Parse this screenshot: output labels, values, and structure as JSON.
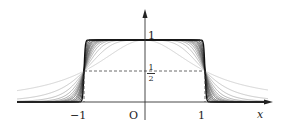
{
  "diagram": {
    "title": "",
    "axes": {
      "x_label": "x",
      "origin_label": "O",
      "x_ticks": [
        {
          "value": -1,
          "label": "−1"
        },
        {
          "value": 1,
          "label": "1"
        }
      ],
      "y_ticks": [
        {
          "value": 1,
          "label": "1"
        },
        {
          "value": 0.5,
          "label_num": "1",
          "label_den": "2"
        }
      ]
    },
    "curves": {
      "family": "1/(1+x^(2n))",
      "n_values": [
        1,
        2,
        3,
        4,
        5,
        6,
        7,
        8,
        10,
        12,
        15,
        20,
        30,
        50
      ],
      "color_light": "#c8c8c8",
      "color_dark": "#111111"
    },
    "guides": {
      "half_line": "dashed horizontal at y=1/2 from x=-1 to x=1",
      "verticals": "dashed verticals at x=±1 from 0 to 1/2"
    }
  },
  "chart_data": {
    "type": "line",
    "title": "",
    "xlabel": "x",
    "ylabel": "",
    "xlim": [
      -2.1,
      2.1
    ],
    "ylim": [
      0,
      1.5
    ],
    "series": [
      {
        "name": "n=1",
        "formula": "1/(1+x^2)"
      },
      {
        "name": "n=2",
        "formula": "1/(1+x^4)"
      },
      {
        "name": "n=3",
        "formula": "1/(1+x^6)"
      },
      {
        "name": "n=large",
        "formula": "1/(1+x^(2n))"
      }
    ],
    "annotations": [
      "1",
      "1/2",
      "−1",
      "O",
      "1",
      "x"
    ],
    "grid": false
  }
}
